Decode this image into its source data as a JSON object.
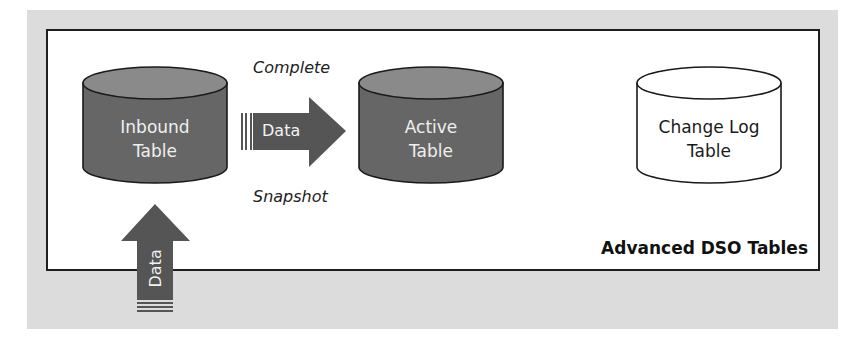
{
  "diagram": {
    "title": "Advanced DSO Tables",
    "tables": [
      {
        "id": "inbound",
        "line1": "Inbound",
        "line2": "Table",
        "style": "filled"
      },
      {
        "id": "active",
        "line1": "Active",
        "line2": "Table",
        "style": "filled"
      },
      {
        "id": "changelog",
        "line1": "Change Log",
        "line2": "Table",
        "style": "outline"
      }
    ],
    "arrows": [
      {
        "id": "load",
        "label": "Data",
        "direction": "up",
        "target": "inbound"
      },
      {
        "id": "activate",
        "label": "Data",
        "direction": "right",
        "from": "inbound",
        "to": "active"
      }
    ],
    "annotations": {
      "above_arrow": "Complete",
      "below_arrow": "Snapshot"
    },
    "colors": {
      "background_panel": "#dcdcdc",
      "frame_border": "#1e1e1e",
      "filled_cylinder": "#666666",
      "filled_cylinder_top": "#8a8a8a",
      "arrow": "#555555",
      "outline": "#1a1a1a"
    }
  }
}
